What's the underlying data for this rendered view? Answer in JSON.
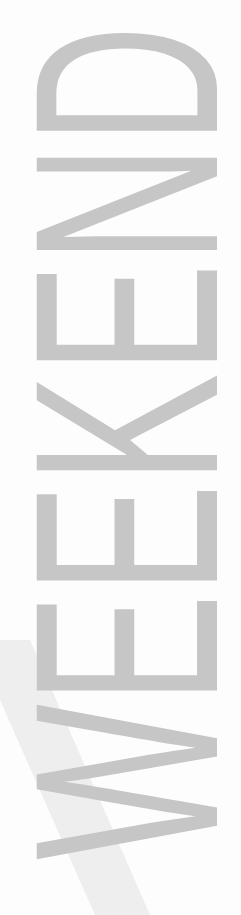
{
  "poster": {
    "word": "WEEKEND",
    "text_color": "#c6c6c6",
    "background": "#fdfdfd",
    "band_color": "#ececec",
    "orientation": "vertical-bottom-to-top"
  }
}
